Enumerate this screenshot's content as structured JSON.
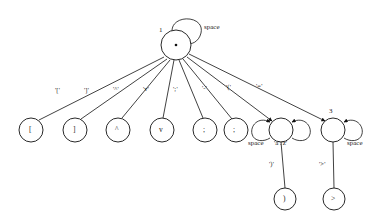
{
  "diagram": {
    "type": "finite-state-machine",
    "stroke_color": "#111111",
    "background": "#ffffff",
    "states": [
      {
        "id": "root",
        "number": "1",
        "glyph": "*",
        "x": 176,
        "y": 45,
        "r": 15
      },
      {
        "id": "s_lbrk",
        "number": "",
        "glyph": "[",
        "x": 31,
        "y": 130,
        "r": 12
      },
      {
        "id": "s_rbrk",
        "number": "",
        "glyph": "]",
        "x": 75,
        "y": 130,
        "r": 12
      },
      {
        "id": "s_caret",
        "number": "",
        "glyph": "^",
        "x": 118,
        "y": 130,
        "r": 12
      },
      {
        "id": "s_vee",
        "number": "",
        "glyph": "v",
        "x": 162,
        "y": 130,
        "r": 12
      },
      {
        "id": "s_semi",
        "number": "",
        "glyph": ";",
        "x": 205,
        "y": 130,
        "r": 12
      },
      {
        "id": "s_not",
        "number": "",
        "glyph": "¬",
        "x": 236,
        "y": 130,
        "r": 12
      },
      {
        "id": "s3",
        "number": "3",
        "glyph": "",
        "x": 281,
        "y": 130,
        "r": 12
      },
      {
        "id": "s2",
        "number": "2",
        "glyph": "",
        "x": 333,
        "y": 130,
        "r": 12
      },
      {
        "id": "s_rpar",
        "number": "",
        "glyph": ")",
        "x": 285,
        "y": 199,
        "r": 11
      },
      {
        "id": "s_gt",
        "number": "",
        "glyph": ">",
        "x": 334,
        "y": 199,
        "r": 11
      }
    ],
    "transitions": [
      {
        "from": "root",
        "to": "s_lbrk",
        "label": "'['",
        "lx": 61,
        "ly": 92
      },
      {
        "from": "root",
        "to": "s_rbrk",
        "label": "']'",
        "lx": 89,
        "ly": 92
      },
      {
        "from": "root",
        "to": "s_caret",
        "label": "'^'",
        "lx": 118,
        "ly": 91
      },
      {
        "from": "root",
        "to": "s_vee",
        "label": "'v'",
        "lx": 148,
        "ly": 91
      },
      {
        "from": "root",
        "to": "s_semi",
        "label": "';'",
        "lx": 178,
        "ly": 91
      },
      {
        "from": "root",
        "to": "s_not",
        "label": "'-'",
        "lx": 207,
        "ly": 90
      },
      {
        "from": "root",
        "to": "s3",
        "label": "'('",
        "lx": 231,
        "ly": 89
      },
      {
        "from": "root",
        "to": "s2",
        "label": "'='",
        "lx": 261,
        "ly": 88
      },
      {
        "from": "s3",
        "to": "s_rpar",
        "label": "')'",
        "lx": 274,
        "ly": 166
      },
      {
        "from": "s2",
        "to": "s_gt",
        "label": "'>'",
        "lx": 324,
        "ly": 166
      }
    ],
    "self_loops": [
      {
        "on": "root",
        "label": "space",
        "side": "top",
        "lx": 199,
        "ly": 28
      },
      {
        "on": "s3",
        "label": "space",
        "side": "left",
        "lx": 253,
        "ly": 143
      },
      {
        "on": "s3",
        "label": "'a'.'z'",
        "side": "right",
        "lx": 277,
        "ly": 143
      },
      {
        "on": "s2",
        "label": "space",
        "side": "right",
        "lx": 352,
        "ly": 143
      }
    ]
  }
}
